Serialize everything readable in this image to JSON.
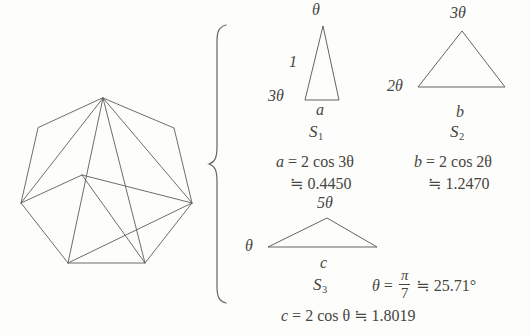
{
  "figure": {
    "line_color": "#5d5c56",
    "text_color": "#46453f",
    "background": "#fdfdfc"
  },
  "polygon": {
    "name": "regular-heptagon",
    "sides": 7,
    "diagonals_from_vertex": 4,
    "description": "Regular heptagon subdivided into 5 triangles by diagonals drawn from the top vertex"
  },
  "brace": {
    "symbol": "{"
  },
  "triangles": [
    {
      "id": "S1",
      "label": "S",
      "subscript": "1",
      "apex_angle": "θ",
      "base_angle": "3θ",
      "side_label": "1",
      "base_label": "a",
      "formula_lhs": "a",
      "formula_rhs": "2 cos 3θ",
      "approx_symbol": "≒",
      "approx_value": "0.4450"
    },
    {
      "id": "S2",
      "label": "S",
      "subscript": "2",
      "apex_angle": "3θ",
      "base_angle": "2θ",
      "base_label": "b",
      "formula_lhs": "b",
      "formula_rhs": "2 cos 2θ",
      "approx_symbol": "≒",
      "approx_value": "1.2470"
    },
    {
      "id": "S3",
      "label": "S",
      "subscript": "3",
      "apex_angle": "5θ",
      "base_angle": "θ",
      "base_label": "c",
      "formula_lhs": "c",
      "formula_rhs": "2 cos θ",
      "approx_symbol": "≒",
      "approx_value": "1.8019"
    }
  ],
  "theta": {
    "symbol": "θ",
    "equals": "=",
    "fraction_numerator": "π",
    "fraction_denominator": "7",
    "approx_symbol": "≒",
    "approx_value": "25.71",
    "degree_symbol": "°"
  }
}
